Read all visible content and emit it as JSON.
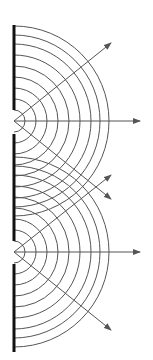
{
  "diagram": {
    "colors": {
      "background": "#ffffff",
      "barrier": "#111111",
      "wavefront": "#555555",
      "ray": "#555555"
    },
    "barrier": {
      "x": 14,
      "segments": [
        [
          25,
          110
        ],
        [
          134,
          241
        ],
        [
          264,
          352
        ]
      ]
    },
    "slits": [
      {
        "name": "upper-slit",
        "x": 14,
        "y": 121
      },
      {
        "name": "lower-slit",
        "x": 14,
        "y": 252
      }
    ],
    "wavefront_radii": [
      11,
      22,
      33,
      44,
      55,
      66,
      77,
      86,
      95
    ],
    "rays": [
      {
        "name": "upper-slit-ray-up",
        "from": [
          14,
          121
        ],
        "to": [
          111,
          43
        ]
      },
      {
        "name": "upper-slit-ray-straight",
        "from": [
          14,
          121
        ],
        "to": [
          140,
          121
        ]
      },
      {
        "name": "upper-slit-ray-down",
        "from": [
          14,
          121
        ],
        "to": [
          111,
          199
        ]
      },
      {
        "name": "lower-slit-ray-up",
        "from": [
          14,
          252
        ],
        "to": [
          111,
          175
        ]
      },
      {
        "name": "lower-slit-ray-straight",
        "from": [
          14,
          252
        ],
        "to": [
          140,
          252
        ]
      },
      {
        "name": "lower-slit-ray-down",
        "from": [
          14,
          252
        ],
        "to": [
          111,
          330
        ]
      }
    ]
  }
}
